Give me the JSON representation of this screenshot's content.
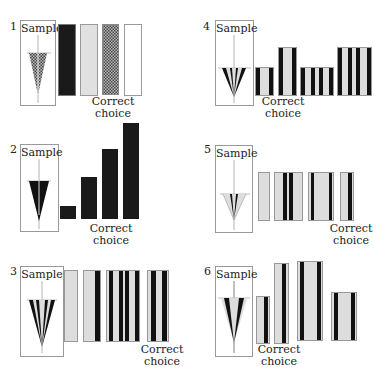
{
  "labels": {
    "sample": "Sample",
    "correct_line1": "Correct",
    "correct_line2": "choice"
  },
  "panels": [
    {
      "number": "1",
      "correct_index": 2,
      "description": "Patterned texture cone; choices: black, light grey, patterned (correct), white"
    },
    {
      "number": "2",
      "correct_index": 1,
      "description": "Black cone; choices: black bars of increasing height, 2nd correct"
    },
    {
      "number": "3",
      "correct_index": 3,
      "description": "Multi-striped cone; choices: plain, one stripe, many stripes, two stripes (correct)"
    },
    {
      "number": "4",
      "correct_index": 0,
      "description": "Striped cone; choices: short 2-stripe (correct), tall 2-stripe, short 4-stripe, tall 4-stripe"
    },
    {
      "number": "5",
      "correct_index": 3,
      "description": "Light striped cone; choices: plain, center stripes, edge stripes, one stripe (correct)"
    },
    {
      "number": "6",
      "correct_index": 1,
      "description": "Cone with dark sides; choices of varying widths/heights, 2nd correct"
    }
  ],
  "colors": {
    "black": "#1a1a1a",
    "grey": "#d9d9d9",
    "border": "#999999"
  }
}
